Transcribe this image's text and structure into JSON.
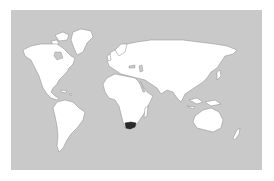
{
  "map": {
    "type": "world-locator-map",
    "ocean_color": "#c9c9c9",
    "land_color": "#ffffff",
    "border_color": "#8a8a8a",
    "highlight_color": "#2a2a2a",
    "highlighted_region": "South Africa",
    "projection": "equirectangular (Pacific cropped)"
  }
}
